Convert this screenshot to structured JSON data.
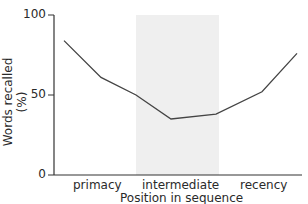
{
  "chart_data": {
    "type": "line",
    "title": "",
    "xlabel": "Position in sequence",
    "ylabel": "Words recalled (%)",
    "ylim": [
      0,
      100
    ],
    "yticks": [
      0,
      50,
      100
    ],
    "grid": false,
    "legend": null,
    "x_category_labels": [
      "primacy",
      "intermediate",
      "recency"
    ],
    "shaded_region": {
      "label": "intermediate",
      "color": "#efefef"
    },
    "x": [
      1,
      2,
      3,
      4,
      5,
      6,
      7
    ],
    "series": [
      {
        "name": "Recall",
        "values": [
          84,
          61,
          50,
          35,
          38,
          52,
          76
        ],
        "color": "#444444"
      }
    ]
  },
  "labels": {
    "y100": "100",
    "y50": "50",
    "y0": "0",
    "cat_primacy": "primacy",
    "cat_intermediate": "intermediate",
    "cat_recency": "recency",
    "xlabel": "Position in sequence",
    "ylabel": "Words recalled (%)"
  }
}
